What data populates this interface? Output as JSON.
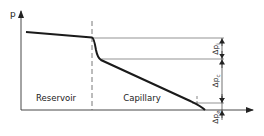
{
  "diagram": {
    "y_axis_label": "p",
    "regions": {
      "left": "Reservoir",
      "right": "Capillary"
    },
    "dimensions": {
      "top": "Δp",
      "top_sub": "i",
      "middle": "Δp",
      "middle_sub": "c",
      "bottom": "Δp",
      "bottom_sub": "e"
    },
    "colors": {
      "line": "#222222",
      "thin": "#555555",
      "background": "#ffffff"
    }
  }
}
